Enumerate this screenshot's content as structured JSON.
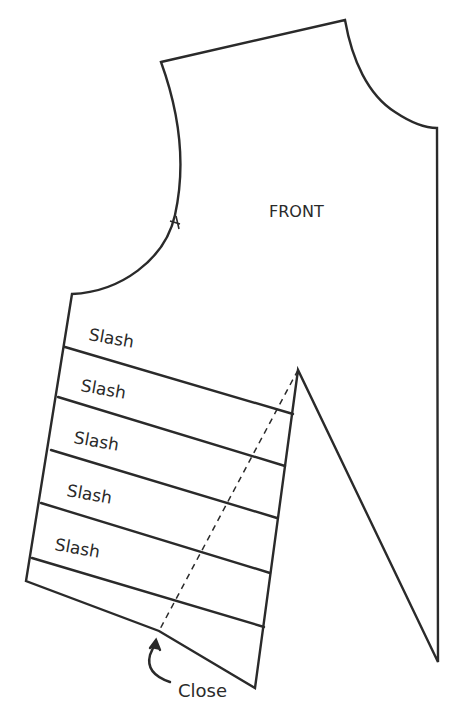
{
  "diagram": {
    "piece_label": "FRONT",
    "slash_labels": [
      "Slash",
      "Slash",
      "Slash",
      "Slash",
      "Slash"
    ],
    "close_label": "Close",
    "line_color": "#2a2a2a",
    "background": "#ffffff"
  }
}
